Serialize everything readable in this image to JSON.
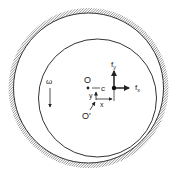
{
  "diagram": {
    "labels": {
      "bearing_center": "O",
      "shaft_center": "O'",
      "clearance": "c",
      "x_disp": "x",
      "y_disp": "y",
      "omega": "ω",
      "fy_main": "f",
      "fy_sub": "y",
      "fx_main": "f",
      "fx_sub": "x"
    },
    "colors": {
      "line": "#333333",
      "hatch": "#555555",
      "background": "#ffffff"
    }
  }
}
